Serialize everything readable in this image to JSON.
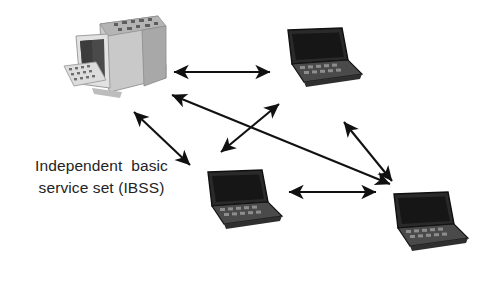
{
  "diagram": {
    "title_lines": [
      "Independent  basic",
      "service set (IBSS)"
    ],
    "caption_text": "Independent basic service set (IBSS)",
    "background_color": "#ffffff",
    "ink_color": "#111111",
    "text_color": "#232323"
  },
  "nodes": [
    {
      "id": "desktop-pc",
      "type": "desktop-computer",
      "label": "Desktop computer",
      "x": 62,
      "y": 8,
      "w": 112,
      "h": 98,
      "screen_color": "#4a4a4a",
      "body_color": "#d8d8d8"
    },
    {
      "id": "laptop-top-right",
      "type": "laptop",
      "label": "Laptop",
      "x": 278,
      "y": 26,
      "w": 86,
      "h": 64,
      "screen_color": "#1d1d1d",
      "body_color": "#3a3a3a"
    },
    {
      "id": "laptop-bottom-center",
      "type": "laptop",
      "label": "Laptop",
      "x": 198,
      "y": 168,
      "w": 86,
      "h": 66,
      "screen_color": "#1d1d1d",
      "body_color": "#3a3a3a"
    },
    {
      "id": "laptop-bottom-right",
      "type": "laptop",
      "label": "Laptop",
      "x": 384,
      "y": 190,
      "w": 88,
      "h": 68,
      "screen_color": "#1d1d1d",
      "body_color": "#3a3a3a"
    }
  ],
  "links": [
    {
      "id": "link-pc-topright",
      "from": "desktop-pc",
      "to": "laptop-top-right",
      "x1": 174,
      "y1": 72,
      "x2": 270,
      "y2": 72,
      "style": "double-arrow"
    },
    {
      "id": "link-pc-bottomcenter",
      "from": "desktop-pc",
      "to": "laptop-bottom-center",
      "x1": 134,
      "y1": 112,
      "x2": 190,
      "y2": 165,
      "style": "double-arrow"
    },
    {
      "id": "link-pc-bottomright",
      "from": "desktop-pc",
      "to": "laptop-bottom-right",
      "x1": 172,
      "y1": 95,
      "x2": 390,
      "y2": 184,
      "style": "double-arrow"
    },
    {
      "id": "link-topright-bottomcenter",
      "from": "laptop-top-right",
      "to": "laptop-bottom-center",
      "x1": 279,
      "y1": 104,
      "x2": 221,
      "y2": 152,
      "style": "double-arrow"
    },
    {
      "id": "link-topright-bottomright",
      "from": "laptop-top-right",
      "to": "laptop-bottom-right",
      "x1": 344,
      "y1": 122,
      "x2": 392,
      "y2": 181,
      "style": "double-arrow"
    },
    {
      "id": "link-bottomcenter-bottomright",
      "from": "laptop-bottom-center",
      "to": "laptop-bottom-right",
      "x1": 289,
      "y1": 192,
      "x2": 376,
      "y2": 192,
      "style": "double-arrow"
    }
  ]
}
